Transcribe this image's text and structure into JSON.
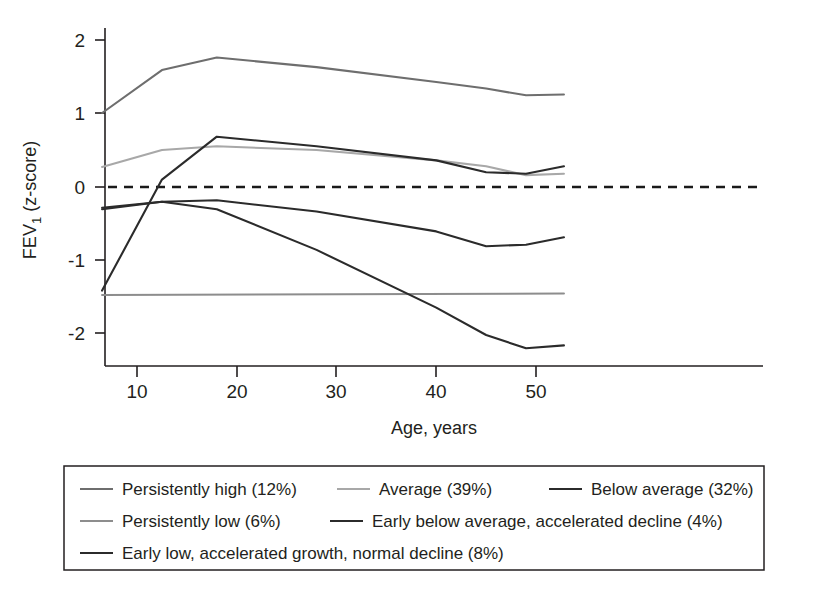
{
  "chart_data": {
    "type": "line",
    "title": "",
    "xlabel": "Age, years",
    "ylabel": "FEV1 (z-score)",
    "ylabel_base": "FEV",
    "ylabel_sub": "1",
    "ylabel_rest": " (z-score)",
    "xlim": [
      6.5,
      52.8
    ],
    "ylim": [
      -2.45,
      2.35
    ],
    "xticks": [
      10,
      20,
      30,
      40,
      50
    ],
    "xtick_labels": [
      "10",
      "20",
      "30",
      "40",
      "50"
    ],
    "yticks": [
      2,
      1,
      0,
      -1,
      -2
    ],
    "ytick_labels": [
      "2",
      "1",
      "0",
      "-1",
      "-2"
    ],
    "grid": false,
    "legend_position": "below-plot",
    "reference_line": {
      "name": "zero-reference",
      "y": 0,
      "style": "dashed",
      "color": "#1a1a1a"
    },
    "series": [
      {
        "name": "Persistently high (12%)",
        "label": "Persistently high (12%)",
        "percent": "12%",
        "color": "#6e6e6e",
        "x": [
          6.5,
          12.5,
          18,
          28,
          40,
          45,
          49,
          52.8
        ],
        "y": [
          1.0,
          1.58,
          1.75,
          1.62,
          1.42,
          1.33,
          1.24,
          1.25
        ]
      },
      {
        "name": "Average (39%)",
        "label": "Average (39%)",
        "percent": "39%",
        "color": "#a8a8a8",
        "x": [
          6.5,
          12.5,
          18,
          28,
          40,
          45,
          49,
          52.8
        ],
        "y": [
          0.27,
          0.5,
          0.55,
          0.5,
          0.36,
          0.28,
          0.16,
          0.18
        ]
      },
      {
        "name": "Below average (32%)",
        "label": "Below average (32%)",
        "percent": "32%",
        "color": "#2b2b2b",
        "x": [
          6.5,
          12.5,
          18,
          28,
          40,
          45,
          49,
          52.8
        ],
        "y": [
          -0.28,
          -0.2,
          -0.18,
          -0.33,
          -0.6,
          -0.8,
          -0.78,
          -0.68
        ]
      },
      {
        "name": "Persistently low (6%)",
        "label": "Persistently low (6%)",
        "percent": "6%",
        "color": "#8d8d8d",
        "x": [
          6.5,
          52.8
        ],
        "y": [
          -1.46,
          -1.44
        ]
      },
      {
        "name": "Early below average, accelerated decline (4%)",
        "label": "Early below average, accelerated decline (4%)",
        "percent": "4%",
        "color": "#2b2b2b",
        "x": [
          6.5,
          12.5,
          18,
          28,
          40,
          45,
          49,
          52.8
        ],
        "y": [
          -0.3,
          -0.2,
          -0.3,
          -0.85,
          -1.63,
          -2.0,
          -2.18,
          -2.14
        ]
      },
      {
        "name": "Early low, accelerated growth, normal decline (8%)",
        "label": "Early low, accelerated growth, normal decline (8%)",
        "percent": "8%",
        "color": "#2b2b2b",
        "x": [
          6.5,
          12.5,
          18,
          28,
          40,
          45,
          49,
          52.8
        ],
        "y": [
          -1.4,
          0.1,
          0.68,
          0.55,
          0.36,
          0.2,
          0.18,
          0.28
        ]
      }
    ]
  },
  "axes": {
    "x_axis_label": "Age, years",
    "y_tick_2": "2",
    "y_tick_1": "1",
    "y_tick_0": "0",
    "y_tick_m1": "-1",
    "y_tick_m2": "-2",
    "x_tick_10": "10",
    "x_tick_20": "20",
    "x_tick_30": "30",
    "x_tick_40": "40",
    "x_tick_50": "50",
    "y_label_main": "FEV",
    "y_label_sub": "1",
    "y_label_tail": "(z-score)"
  },
  "legend": {
    "row1": [
      {
        "label": "Persistently high (12%)",
        "color": "#6e6e6e"
      },
      {
        "label": "Average (39%)",
        "color": "#a8a8a8"
      },
      {
        "label": "Below average (32%)",
        "color": "#2b2b2b"
      }
    ],
    "row2": [
      {
        "label": "Persistently low (6%)",
        "color": "#8d8d8d"
      },
      {
        "label": "Early below average, accelerated decline (4%)",
        "color": "#2b2b2b"
      }
    ],
    "row3": [
      {
        "label": "Early low, accelerated growth, normal decline (8%)",
        "color": "#2b2b2b"
      }
    ]
  },
  "colors": {
    "axis": "#231f20",
    "background": "#ffffff",
    "persistently_high": "#6e6e6e",
    "average": "#a8a8a8",
    "below_average": "#2b2b2b",
    "persistently_low": "#8d8d8d",
    "early_below_average": "#2b2b2b",
    "early_low": "#2b2b2b"
  }
}
